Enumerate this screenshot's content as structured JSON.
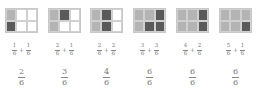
{
  "colors": {
    "light": "#b4b4b4",
    "dark": "#5a5a5a",
    "empty": "#ffffff"
  },
  "items": [
    {
      "grid": [
        "l",
        "w",
        "w",
        "d",
        "w",
        "w"
      ],
      "a_num": "1",
      "a_den": "6",
      "op": "+",
      "b_num": "1",
      "b_den": "6",
      "r_num": "2",
      "r_den": "6"
    },
    {
      "grid": [
        "l",
        "d",
        "w",
        "l",
        "w",
        "w"
      ],
      "a_num": "2",
      "a_den": "6",
      "op": "+",
      "b_num": "1",
      "b_den": "6",
      "r_num": "3",
      "r_den": "6"
    },
    {
      "grid": [
        "l",
        "d",
        "w",
        "l",
        "d",
        "w"
      ],
      "a_num": "2",
      "a_den": "6",
      "op": "+",
      "b_num": "2",
      "b_den": "6",
      "r_num": "4",
      "r_den": "6"
    },
    {
      "grid": [
        "l",
        "l",
        "d",
        "l",
        "d",
        "d"
      ],
      "a_num": "3",
      "a_den": "6",
      "op": "+",
      "b_num": "3",
      "b_den": "6",
      "r_num": "6",
      "r_den": "6"
    },
    {
      "grid": [
        "l",
        "l",
        "d",
        "l",
        "l",
        "d"
      ],
      "a_num": "4",
      "a_den": "6",
      "op": "+",
      "b_num": "2",
      "b_den": "6",
      "r_num": "6",
      "r_den": "6"
    },
    {
      "grid": [
        "l",
        "l",
        "l",
        "l",
        "l",
        "d"
      ],
      "a_num": "5",
      "a_den": "6",
      "op": "+",
      "b_num": "1",
      "b_den": "6",
      "r_num": "6",
      "r_den": "6"
    }
  ]
}
